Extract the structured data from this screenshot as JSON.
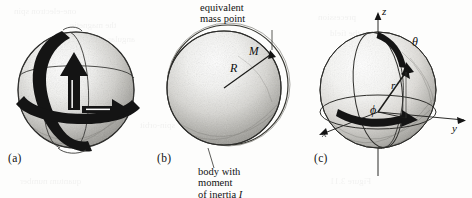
{
  "figure": {
    "background_color": "#fdfdfc",
    "ink_color": "#111111",
    "panels": [
      {
        "id": "a",
        "label": "(a)",
        "description": "shaded sphere with two perpendicular rotation bands and arrows"
      },
      {
        "id": "b",
        "label": "(b)",
        "description": "shaded sphere inside a thin outer shell, radius R drawn to equivalent mass point M"
      },
      {
        "id": "c",
        "label": "(c)",
        "description": "sphere with spherical polar coordinate axes z, y, x and angles theta, phi, radius r"
      }
    ]
  },
  "captions": {
    "equivalent_mass_point_line1": "equivalent",
    "equivalent_mass_point_line2": "mass point",
    "body_line1": "body with",
    "body_line2": "moment",
    "body_line3_prefix": "of inertia ",
    "body_line3_symbol": "I"
  },
  "panel_b_labels": {
    "radius": "R",
    "mass": "M"
  },
  "panel_c_labels": {
    "axis_z": "z",
    "axis_y": "y",
    "axis_x": "x",
    "angle_theta": "θ",
    "angle_phi": "ϕ",
    "radius_r": "r"
  },
  "ghost_text": [
    {
      "text": "one-electron spin",
      "x": 14,
      "y": 6,
      "size": 9
    },
    {
      "text": "the magnetic",
      "x": 70,
      "y": 20,
      "size": 9
    },
    {
      "text": "angular",
      "x": 108,
      "y": 34,
      "size": 9
    },
    {
      "text": "of the nucleus",
      "x": 190,
      "y": 58,
      "size": 9
    },
    {
      "text": "moment",
      "x": 250,
      "y": 78,
      "size": 9
    },
    {
      "text": "precession",
      "x": 318,
      "y": 12,
      "size": 9
    },
    {
      "text": "in the field",
      "x": 330,
      "y": 28,
      "size": 9
    },
    {
      "text": "quantum number",
      "x": 20,
      "y": 176,
      "size": 9
    },
    {
      "text": "Figure 3.11",
      "x": 330,
      "y": 176,
      "size": 9
    },
    {
      "text": "spin-orbit",
      "x": 140,
      "y": 120,
      "size": 9
    }
  ]
}
